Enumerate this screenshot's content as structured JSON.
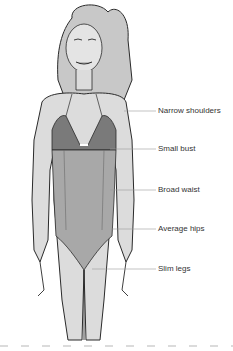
{
  "diagram": {
    "colors": {
      "skin": "#dcdcdc",
      "outline": "#2a2a2a",
      "swimsuit": "#a8a8a8",
      "bra": "#7a7a7a",
      "hair": "#c8c8c8",
      "leader": "#9a9a9a",
      "divider": "#cfcfcf",
      "text": "#333333"
    },
    "labels": [
      {
        "text": "Narrow shoulders",
        "y": 110
      },
      {
        "text": "Small bust",
        "y": 148
      },
      {
        "text": "Broad waist",
        "y": 189
      },
      {
        "text": "Average hips",
        "y": 228
      },
      {
        "text": "Slim legs",
        "y": 268
      }
    ]
  }
}
